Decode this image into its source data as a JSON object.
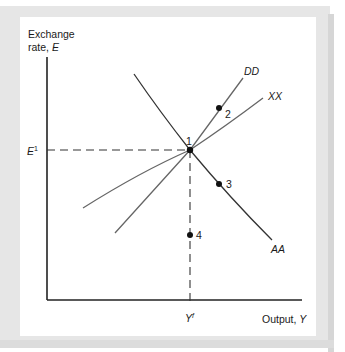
{
  "figure": {
    "y_axis_label_line1": "Exchange",
    "y_axis_label_line2": "rate, ",
    "y_axis_symbol": "E",
    "x_axis_label": "Output, ",
    "x_axis_symbol": "Y",
    "e_tick_symbol": "E",
    "e_tick_superscript": "1",
    "y_tick_symbol": "Y",
    "y_tick_superscript": "f",
    "curves": [
      {
        "name": "DD",
        "label": "DD"
      },
      {
        "name": "XX",
        "label": "XX"
      },
      {
        "name": "AA",
        "label": "AA"
      }
    ],
    "points": [
      {
        "id": "1",
        "label": "1"
      },
      {
        "id": "2",
        "label": "2"
      },
      {
        "id": "3",
        "label": "3"
      },
      {
        "id": "4",
        "label": "4"
      }
    ]
  },
  "colors": {
    "frame": "#e6e6e6",
    "axis": "#222222",
    "curve": "#555555",
    "aa_curve": "#333333"
  }
}
